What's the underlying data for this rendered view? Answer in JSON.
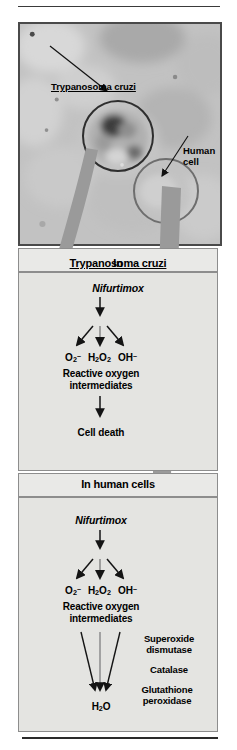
{
  "figure": {
    "type": "biomedical-pathway-diagram"
  },
  "micrograph": {
    "label_parasite": "Trypanosoma cruzi",
    "label_human": "Human\ncell",
    "label_human_line1": "Human",
    "label_human_line2": "cell",
    "callout_parasite": "circle-parasite",
    "callout_human": "circle-human-cell"
  },
  "sections": [
    {
      "id": "trypanosoma",
      "header_prefix": "In ",
      "header_organism": "Trypanosoma cruzi",
      "header_full": "In Trypanosoma cruzi",
      "drug": "Nifurtimox",
      "ros": [
        {
          "formula": "O2-",
          "base": "O",
          "sub": "2",
          "sup": "–"
        },
        {
          "formula": "H2O2",
          "base": "H",
          "sub": "2",
          "base2": "O",
          "sub2": "2"
        },
        {
          "formula": "OH-",
          "base": "OH",
          "sup": "–"
        }
      ],
      "ros_group_label_line1": "Reactive oxygen",
      "ros_group_label_line2": "intermediates",
      "outcome": "Cell death",
      "enzymes": []
    },
    {
      "id": "human",
      "header_prefix": "In ",
      "header_organism": "human cells",
      "header_full": "In human cells",
      "drug": "Nifurtimox",
      "ros": [
        {
          "formula": "O2-",
          "base": "O",
          "sub": "2",
          "sup": "–"
        },
        {
          "formula": "H2O2",
          "base": "H",
          "sub": "2",
          "base2": "O",
          "sub2": "2"
        },
        {
          "formula": "OH-",
          "base": "OH",
          "sup": "–"
        }
      ],
      "ros_group_label_line1": "Reactive oxygen",
      "ros_group_label_line2": "intermediates",
      "outcome": "H2O",
      "outcome_base": "H",
      "outcome_sub": "2",
      "outcome_base2": "O",
      "enzymes": [
        {
          "line1": "Superoxide",
          "line2": "dismutase"
        },
        {
          "line1": "Catalase",
          "line2": ""
        },
        {
          "line1": "Glutathione",
          "line2": "peroxidase"
        }
      ]
    }
  ],
  "connectors": {
    "parasite_arrow": "curved-gray-arrow-to-trypanosoma-panel",
    "human_arrow": "long-gray-arrow-to-human-panel"
  },
  "colors": {
    "panel_bg": "#e4e4e1",
    "header_bg": "#e9e9e7",
    "border": "#8d8d8d",
    "big_arrow": "#9a9a9a",
    "arrow_black": "#1a1a1a",
    "micro_border": "#4a4a4a"
  }
}
